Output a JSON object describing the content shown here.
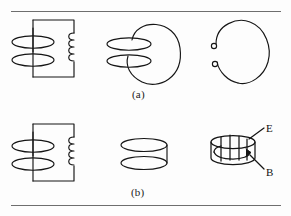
{
  "figure": {
    "background_color": "#fdfdfd",
    "ink_color": "#151515",
    "rule_color": "#6e6e6e",
    "rows": [
      {
        "caption": "(a)",
        "panels": [
          {
            "name": "circuit-with-coil-open",
            "description": "rectangular circuit loop with two flat ellipse turns at left and a helical inductor coil on the right leg"
          },
          {
            "name": "coil-linking-large-loop",
            "description": "two flat ellipse turns threading a large vertical oval loop"
          },
          {
            "name": "open-loop-terminals",
            "description": "large vertical loop broken open on the left with two small circular terminals"
          }
        ]
      },
      {
        "caption": "(b)",
        "panels": [
          {
            "name": "circuit-with-coil-closed",
            "description": "rectangular circuit loop with two flat ellipse turns at left and a helical inductor coil on the right leg"
          },
          {
            "name": "cylinder-plain",
            "description": "short cylinder drawn as two stacked ellipses joined at the right side"
          },
          {
            "name": "cylinder-fields",
            "description": "short cylinder with vertical electric field lines and a circulating magnetic field arrow"
          }
        ]
      }
    ],
    "labels": {
      "electric_field": "E",
      "magnetic_field": "B"
    }
  }
}
